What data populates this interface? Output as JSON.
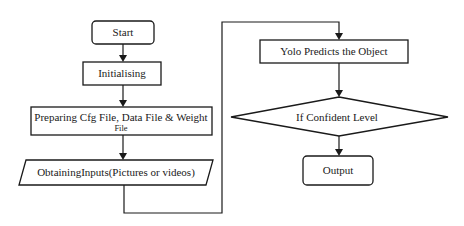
{
  "diagram": {
    "type": "flowchart",
    "nodes": [
      {
        "id": "start",
        "shape": "rounded-rect",
        "label": "Start"
      },
      {
        "id": "init",
        "shape": "rect",
        "label": "Initialising"
      },
      {
        "id": "prepare",
        "shape": "rect",
        "label_line1": "Preparing Cfg File, Data File & Weight",
        "label_line2": "File"
      },
      {
        "id": "inputs",
        "shape": "parallelogram",
        "label": "ObtainingInputs(Pictures or videos)"
      },
      {
        "id": "yolo",
        "shape": "rect",
        "label": "Yolo Predicts the Object"
      },
      {
        "id": "confident",
        "shape": "diamond",
        "label": "If Confident Level"
      },
      {
        "id": "output",
        "shape": "rounded-rect",
        "label": "Output"
      }
    ],
    "edges": [
      {
        "from": "start",
        "to": "init"
      },
      {
        "from": "init",
        "to": "prepare"
      },
      {
        "from": "prepare",
        "to": "inputs"
      },
      {
        "from": "inputs",
        "to": "yolo"
      },
      {
        "from": "yolo",
        "to": "confident"
      },
      {
        "from": "confident",
        "to": "output"
      }
    ]
  }
}
